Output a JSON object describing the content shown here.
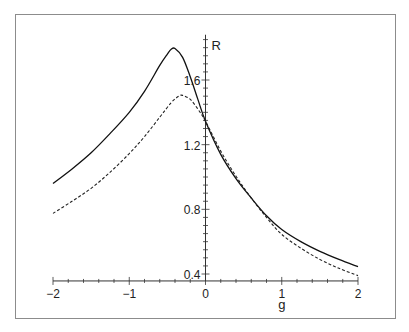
{
  "chart_data": {
    "type": "line",
    "title": "",
    "xlabel": "g",
    "ylabel": "R",
    "xlim": [
      -2,
      2
    ],
    "ylim": [
      0.357,
      1.88
    ],
    "x_ticks": [
      -2,
      -1,
      0,
      1,
      2
    ],
    "x_tick_labels": [
      "−2",
      "−1",
      "0",
      "1",
      "2"
    ],
    "x_minor_step": 0.2,
    "y_ticks": [
      0.4,
      0.8,
      1.2,
      1.6
    ],
    "y_tick_labels": [
      "0.4",
      "0.8",
      "1.2",
      "1.6"
    ],
    "y_minor_step": 0.05,
    "axes_cross_at": {
      "x": 0,
      "y": 0.357
    },
    "grid": false,
    "legend": null,
    "series": [
      {
        "name": "solid",
        "style": "solid",
        "color": "#111111",
        "x": [
          -2.0,
          -1.75,
          -1.5,
          -1.25,
          -1.0,
          -0.8,
          -0.6,
          -0.5,
          -0.45,
          -0.4,
          -0.3,
          -0.2,
          -0.1,
          0.0,
          0.2,
          0.4,
          0.6,
          0.8,
          1.0,
          1.25,
          1.5,
          1.75,
          2.0
        ],
        "y": [
          0.96,
          1.05,
          1.15,
          1.27,
          1.4,
          1.53,
          1.69,
          1.76,
          1.79,
          1.795,
          1.74,
          1.62,
          1.48,
          1.345,
          1.14,
          0.99,
          0.87,
          0.76,
          0.675,
          0.6,
          0.54,
          0.49,
          0.445
        ]
      },
      {
        "name": "dashed",
        "style": "dashed",
        "color": "#222222",
        "x": [
          -2.0,
          -1.75,
          -1.5,
          -1.25,
          -1.0,
          -0.8,
          -0.6,
          -0.45,
          -0.35,
          -0.3,
          -0.2,
          -0.1,
          0.0,
          0.2,
          0.4,
          0.6,
          0.8,
          1.0,
          1.25,
          1.5,
          1.75,
          2.0
        ],
        "y": [
          0.775,
          0.85,
          0.93,
          1.03,
          1.145,
          1.25,
          1.37,
          1.46,
          1.5,
          1.505,
          1.48,
          1.42,
          1.345,
          1.16,
          1.005,
          0.87,
          0.75,
          0.645,
          0.56,
          0.49,
          0.435,
          0.39
        ]
      }
    ]
  }
}
